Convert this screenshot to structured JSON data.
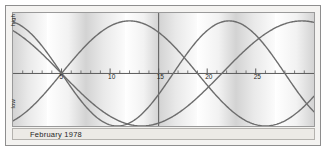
{
  "figure": {
    "caption": "February 1978",
    "y_axis": {
      "high_label": "high",
      "low_label": "low"
    }
  },
  "chart_data": {
    "type": "line",
    "title": "",
    "subtitle": "February 1978",
    "xlabel": "",
    "ylabel": "",
    "xlim": [
      0,
      31
    ],
    "ylim": [
      -1,
      1
    ],
    "grid": false,
    "legend": "none",
    "axis_line_value": 0,
    "tick_labels": [
      "5",
      "10",
      "15",
      "20",
      "25"
    ],
    "tick_values": [
      5,
      10,
      15,
      20,
      25
    ],
    "minor_ticks_every": 1,
    "divider_at_x": 15,
    "y_tick_labels": [
      "high",
      "low"
    ],
    "background_bands_note": "alternating light/shaded weekly gradient bands",
    "band_edges": [
      0,
      3.5,
      7.5,
      11.5,
      15.0,
      19.0,
      23.0,
      27.0,
      31.0
    ],
    "series": [
      {
        "name": "physical",
        "period_days": 23,
        "phase_zero_crossing_day": 5,
        "direction": "descending-at-crossing",
        "color": "#6d6d6d"
      },
      {
        "name": "emotional",
        "period_days": 28,
        "phase_zero_crossing_day": 5,
        "direction": "ascending-at-crossing",
        "color": "#6d6d6d"
      },
      {
        "name": "intellectual",
        "period_days": 33,
        "phase_zero_crossing_day": 5,
        "direction": "descending-at-crossing",
        "color": "#6d6d6d"
      }
    ]
  },
  "colors": {
    "curve": "#6d6d6d",
    "axis": "#5a5a5a",
    "frame": "#8e8e8e",
    "band_light": "#ffffff",
    "band_shade": "#d3d3d3",
    "caption_bg": "#eceae6",
    "page_bg": "#ffffff"
  }
}
